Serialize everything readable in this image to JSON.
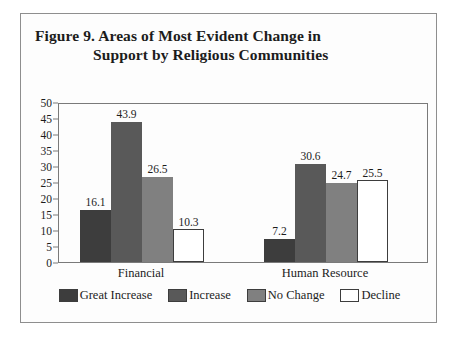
{
  "figure": {
    "title_line1": "Figure 9.  Areas of Most Evident Change in",
    "title_line2": "Support by Religious Communities"
  },
  "chart_data": {
    "type": "bar",
    "title": "Figure 9.  Areas of Most Evident Change in Support by Religious Communities",
    "xlabel": "",
    "ylabel": "",
    "ylim": [
      0,
      50
    ],
    "yticks": [
      0,
      5,
      10,
      15,
      20,
      25,
      30,
      35,
      40,
      45,
      50
    ],
    "ytick_labels": [
      "0",
      "5",
      "10",
      "15",
      "20",
      "25",
      "30",
      "35",
      "40",
      "45",
      "50"
    ],
    "grid": false,
    "legend_position": "bottom",
    "categories": [
      "Financial",
      "Human Resource"
    ],
    "series": [
      {
        "name": "Great Increase",
        "color": "#3d3d3d",
        "values": [
          16.1,
          7.2
        ],
        "value_labels": [
          "16.1",
          "7.2"
        ]
      },
      {
        "name": "Increase",
        "color": "#595959",
        "values": [
          43.9,
          30.6
        ],
        "value_labels": [
          "43.9",
          "30.6"
        ]
      },
      {
        "name": "No Change",
        "color": "#808080",
        "values": [
          26.5,
          24.7
        ],
        "value_labels": [
          "26.5",
          "24.7"
        ]
      },
      {
        "name": "Decline",
        "color": "#ffffff",
        "values": [
          10.3,
          25.5
        ],
        "value_labels": [
          "10.3",
          "25.5"
        ]
      }
    ]
  },
  "colors": {
    "frame_border": "#8e8e8e",
    "axis": "#7a7a7a",
    "background": "#fdfdfd",
    "text": "#1c1c1c"
  }
}
